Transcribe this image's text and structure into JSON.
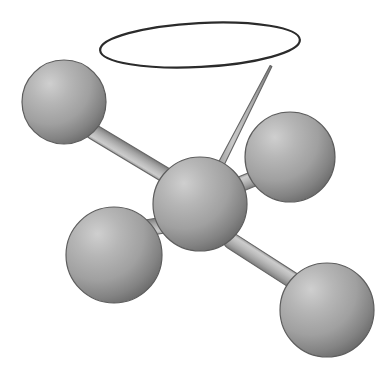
{
  "figure": {
    "title": "Ball-and-stick molecular model with lone-pair orbital ellipse",
    "background_color": "#ffffff",
    "width": 391,
    "height": 371
  },
  "palette": {
    "sphere_highlight": "#c3c3c3",
    "sphere_mid": "#a0a0a0",
    "sphere_shadow": "#6e6e6e",
    "sphere_outline": "#5d5d5d",
    "bond_highlight": "#cfcfcf",
    "bond_mid": "#b2b2b2",
    "bond_shadow": "#8a8a8a",
    "bond_outline": "#666666",
    "orbital_stroke": "#2b2b2b",
    "orbital_fill": "#ffffff"
  },
  "orbital": {
    "label": "lone-pair-orbital",
    "shape": "ellipse",
    "cx": 200,
    "cy": 45,
    "rx": 100,
    "ry": 22,
    "stroke_width": 2.2,
    "rotation_deg": -3
  },
  "atoms": [
    {
      "id": "center",
      "label": "central-atom",
      "cx": 200,
      "cy": 204,
      "r": 47,
      "highlight_x": 180,
      "highlight_y": 180
    },
    {
      "id": "upper-left",
      "label": "upper-left-atom",
      "cx": 64,
      "cy": 102,
      "r": 42,
      "highlight_x": 47,
      "highlight_y": 82
    },
    {
      "id": "right",
      "label": "right-atom",
      "cx": 290,
      "cy": 157,
      "r": 45,
      "highlight_x": 272,
      "highlight_y": 135
    },
    {
      "id": "lower-left",
      "label": "lower-left-atom",
      "cx": 114,
      "cy": 255,
      "r": 48,
      "highlight_x": 95,
      "highlight_y": 232
    },
    {
      "id": "lower-right",
      "label": "lower-right-atom",
      "cx": 327,
      "cy": 310,
      "r": 47,
      "highlight_x": 309,
      "highlight_y": 288
    }
  ],
  "bonds": [
    {
      "id": "center-upper-left",
      "label": "bond-center-upper-left",
      "x1": 167,
      "y1": 176,
      "x2": 92,
      "y2": 131,
      "width": 15
    },
    {
      "id": "center-right",
      "label": "bond-center-right",
      "x1": 236,
      "y1": 186,
      "x2": 270,
      "y2": 172,
      "width": 15
    },
    {
      "id": "center-lower-left",
      "label": "bond-center-lower-left",
      "x1": 170,
      "y1": 224,
      "x2": 146,
      "y2": 228,
      "width": 16
    },
    {
      "id": "center-lower-right",
      "label": "bond-center-lower-right",
      "x1": 230,
      "y1": 240,
      "x2": 300,
      "y2": 285,
      "width": 16
    }
  ],
  "orbital_bond": {
    "id": "center-orbital",
    "label": "tapered-bond-to-orbital",
    "tip_x": 271,
    "tip_y": 66,
    "base_x": 214,
    "base_y": 178,
    "tip_width": 2.0,
    "base_width": 7.0
  }
}
